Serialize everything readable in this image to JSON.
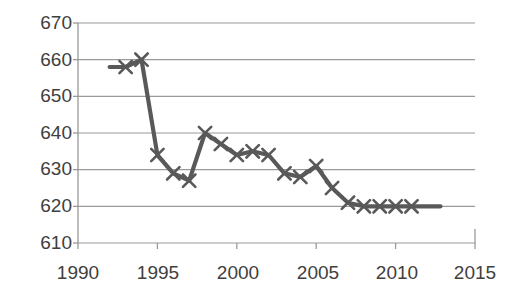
{
  "chart_data": {
    "type": "line",
    "title": "",
    "subtitle": "",
    "xlabel": "",
    "ylabel": "",
    "xlim": [
      1990,
      2015
    ],
    "ylim": [
      610,
      670
    ],
    "xticks": [
      1990,
      1995,
      2000,
      2005,
      2010,
      2015
    ],
    "yticks": [
      610,
      620,
      630,
      640,
      650,
      660,
      670
    ],
    "grid": "horizontal",
    "legend": "none",
    "marker": "x",
    "series": [
      {
        "name": "series-1",
        "color": "#595959",
        "x": [
          1993,
          1994,
          1995,
          1996,
          1997,
          1998,
          1999,
          2000,
          2001,
          2002,
          2003,
          2004,
          2005,
          2006,
          2007,
          2008,
          2009,
          2010,
          2011
        ],
        "values": [
          658,
          660,
          634,
          629,
          627,
          640,
          637,
          634,
          635,
          634,
          629,
          628,
          631,
          625,
          621,
          620,
          620,
          620,
          620
        ]
      }
    ],
    "annotations": []
  },
  "axis": {
    "y_tick_labels": [
      "670",
      "660",
      "650",
      "640",
      "630",
      "620",
      "610"
    ],
    "x_tick_labels": [
      "1990",
      "1995",
      "2000",
      "2005",
      "2010",
      "2015"
    ]
  },
  "colors": {
    "line": "#595959",
    "grid": "#9a9a9a",
    "axis": "#9a9a9a",
    "text": "#404040",
    "background": "#ffffff"
  }
}
